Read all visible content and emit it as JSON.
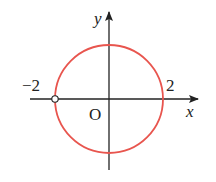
{
  "figure": {
    "circle": {
      "radius": 2,
      "color": "#e8554e"
    },
    "open_point": {
      "x": -2,
      "y": 0
    },
    "labels": {
      "y_axis": "y",
      "x_axis": "x",
      "origin": "O",
      "neg_two": "−2",
      "pos_two": "2"
    },
    "colors": {
      "axis": "#222222",
      "circle": "#e8554e"
    }
  }
}
